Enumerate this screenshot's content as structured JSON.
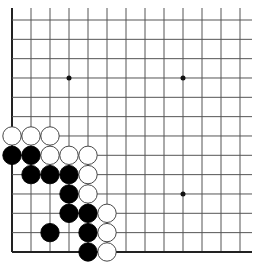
{
  "board": {
    "view": "lower-left corner",
    "origin_x": 12,
    "origin_y": 20,
    "spacing_x": 19,
    "spacing_y": 19.33,
    "cols": 13,
    "rows": 13,
    "line_color": "#555555",
    "edge_color": "#222222",
    "star_points": [
      [
        3,
        3
      ],
      [
        9,
        3
      ],
      [
        9,
        9
      ]
    ],
    "stone_radius": 9.2
  },
  "stones": [
    {
      "color": "white",
      "col": 0,
      "row": 6
    },
    {
      "color": "white",
      "col": 1,
      "row": 6
    },
    {
      "color": "white",
      "col": 2,
      "row": 6
    },
    {
      "color": "black",
      "col": 0,
      "row": 7
    },
    {
      "color": "black",
      "col": 1,
      "row": 7
    },
    {
      "color": "white",
      "col": 2,
      "row": 7
    },
    {
      "color": "white",
      "col": 3,
      "row": 7
    },
    {
      "color": "white",
      "col": 4,
      "row": 7
    },
    {
      "color": "black",
      "col": 1,
      "row": 8
    },
    {
      "color": "black",
      "col": 2,
      "row": 8
    },
    {
      "color": "black",
      "col": 3,
      "row": 8
    },
    {
      "color": "white",
      "col": 4,
      "row": 8
    },
    {
      "color": "black",
      "col": 3,
      "row": 9
    },
    {
      "color": "white",
      "col": 4,
      "row": 9
    },
    {
      "color": "black",
      "col": 3,
      "row": 10
    },
    {
      "color": "black",
      "col": 4,
      "row": 10
    },
    {
      "color": "white",
      "col": 5,
      "row": 10
    },
    {
      "color": "black",
      "col": 2,
      "row": 11
    },
    {
      "color": "black",
      "col": 4,
      "row": 11
    },
    {
      "color": "white",
      "col": 5,
      "row": 11
    },
    {
      "color": "black",
      "col": 4,
      "row": 12
    },
    {
      "color": "white",
      "col": 5,
      "row": 12
    }
  ]
}
